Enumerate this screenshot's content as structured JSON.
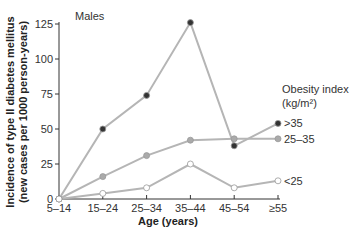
{
  "chart_data": {
    "type": "line",
    "title": "Males",
    "xlabel": "Age (years)",
    "ylabel_line1": "Incidence of type II diabetes mellitus",
    "ylabel_line2": "(new cases per 1000 person-years)",
    "categories": [
      "5–14",
      "15–24",
      "25–34",
      "35–44",
      "45–54",
      "≥55"
    ],
    "yticks": [
      0,
      25,
      50,
      75,
      100,
      125
    ],
    "ylim": [
      0,
      125
    ],
    "grid": false,
    "legend_title_line1": "Obesity index",
    "legend_title_line2": "(kg/m²)",
    "legend_position": "right",
    "series": [
      {
        "name": ">35",
        "values": [
          0,
          50,
          74,
          126,
          38,
          54
        ],
        "marker_color": "#333333"
      },
      {
        "name": "25–35",
        "values": [
          0,
          16,
          31,
          42,
          43,
          43
        ],
        "marker_color": "#aaaaaa"
      },
      {
        "name": "<25",
        "values": [
          0,
          4,
          8,
          25,
          8,
          13
        ],
        "marker_color": "#ffffff"
      }
    ],
    "line_color": "#b5b5b5"
  }
}
